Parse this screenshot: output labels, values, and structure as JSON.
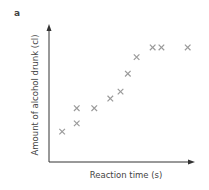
{
  "panel_label": "a",
  "chart_data": {
    "type": "scatter",
    "title": "",
    "panel_label": "a",
    "xlabel": "Reaction time (s)",
    "ylabel": "Amount of alcohol drunk (cl)",
    "xlim": [
      0,
      10
    ],
    "ylim": [
      0,
      10
    ],
    "grid": false,
    "legend": null,
    "axis_ticks": "none",
    "marker": "x",
    "marker_color": "#9a9a9a",
    "axis_color": "#333333",
    "series": [
      {
        "name": "observations",
        "x": [
          0.9,
          1.9,
          1.9,
          3.1,
          4.2,
          4.9,
          5.4,
          6.0,
          7.1,
          7.7,
          9.5
        ],
        "y": [
          2.2,
          2.8,
          3.9,
          3.9,
          4.6,
          5.1,
          6.4,
          7.6,
          8.3,
          8.3,
          8.3
        ]
      }
    ]
  },
  "layout": {
    "origin_px": [
      49,
      162
    ],
    "x_end_px": 195,
    "y_end_px": 24,
    "x_unit_px": 14.6,
    "y_unit_px": 13.8
  }
}
